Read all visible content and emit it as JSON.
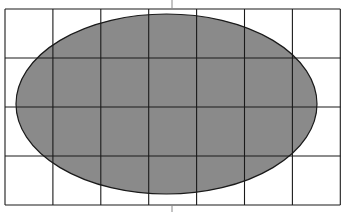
{
  "diagram": {
    "type": "ellipse-on-grid",
    "grid": {
      "columns": 7,
      "rows": 4,
      "left": 5,
      "top": 9,
      "cell_width": 47.9,
      "cell_height": 49,
      "line_color": "#1a1a1a",
      "background": "#ffffff"
    },
    "ellipse": {
      "cx": 166.5,
      "cy": 104,
      "rx": 150.5,
      "ry": 90,
      "fill": "#8a8a8a",
      "stroke": "#1a1a1a"
    },
    "center_ticks": {
      "x": 172,
      "top": [
        0,
        9
      ],
      "bottom": [
        205,
        212
      ],
      "color": "#888888"
    }
  }
}
